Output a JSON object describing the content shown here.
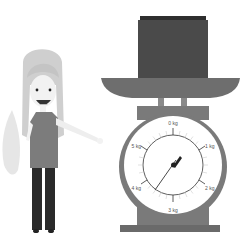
{
  "illustration": {
    "subject": "girl pointing at kitchen scale with box",
    "colors": {
      "background": "#ffffff",
      "scale_body": "#7a7a7a",
      "box": "#4a4a4a",
      "box_top": "#2e2e2e",
      "dial_face": "#ffffff",
      "hair": "#cfcfcf",
      "skin": "#f2f2f2",
      "shirt": "#7c7c7c",
      "pants": "#2a2a2a",
      "leaf": "#e6e6e6"
    }
  },
  "scale": {
    "dial_labels": {
      "top": "0 kg",
      "upper_right": "1 kg",
      "lower_right": "2 kg",
      "bottom": "3 kg",
      "lower_left": "4 kg",
      "upper_left": "5 kg"
    }
  }
}
